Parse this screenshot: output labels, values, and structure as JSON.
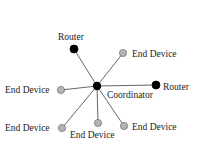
{
  "diagram": {
    "type": "star-network-topology",
    "coordinator": {
      "label": "Coordinator",
      "x": 97,
      "y": 86,
      "color": "#000000",
      "label_x": 107,
      "label_y": 98
    },
    "nodes": [
      {
        "role": "router",
        "label": "Router",
        "x": 74,
        "y": 49,
        "color": "#000000",
        "label_x": 58,
        "label_y": 40,
        "anchor": "start"
      },
      {
        "role": "end-device",
        "label": "End Device",
        "x": 123,
        "y": 53,
        "color": "#b3b3b3",
        "label_x": 132,
        "label_y": 57,
        "anchor": "start"
      },
      {
        "role": "router",
        "label": "Router",
        "x": 156,
        "y": 85,
        "color": "#000000",
        "label_x": 163,
        "label_y": 90,
        "anchor": "start"
      },
      {
        "role": "end-device",
        "label": "End Device",
        "x": 61,
        "y": 90,
        "color": "#b3b3b3",
        "label_x": 5,
        "label_y": 93,
        "anchor": "start"
      },
      {
        "role": "end-device",
        "label": "End Device",
        "x": 62,
        "y": 128,
        "color": "#b3b3b3",
        "label_x": 5,
        "label_y": 131,
        "anchor": "start"
      },
      {
        "role": "end-device",
        "label": "End Device",
        "x": 98,
        "y": 123,
        "color": "#b3b3b3",
        "label_x": 70,
        "label_y": 138,
        "anchor": "start"
      },
      {
        "role": "end-device",
        "label": "End Device",
        "x": 124,
        "y": 126,
        "color": "#b3b3b3",
        "label_x": 132,
        "label_y": 130,
        "anchor": "start"
      }
    ],
    "edge_color": "#555555"
  }
}
